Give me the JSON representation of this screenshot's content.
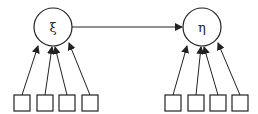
{
  "diagram": {
    "latent_left": {
      "label": "ξ",
      "cx": 53,
      "cy": 27,
      "r": 19
    },
    "latent_right": {
      "label": "η",
      "cx": 202,
      "cy": 27,
      "r": 19
    },
    "left_indicators": [
      {
        "x": 14,
        "y": 95,
        "w": 16,
        "h": 16
      },
      {
        "x": 37,
        "y": 95,
        "w": 16,
        "h": 16
      },
      {
        "x": 59,
        "y": 95,
        "w": 16,
        "h": 16
      },
      {
        "x": 82,
        "y": 95,
        "w": 16,
        "h": 16
      }
    ],
    "right_indicators": [
      {
        "x": 165,
        "y": 95,
        "w": 16,
        "h": 16
      },
      {
        "x": 188,
        "y": 95,
        "w": 16,
        "h": 16
      },
      {
        "x": 210,
        "y": 95,
        "w": 16,
        "h": 16
      },
      {
        "x": 232,
        "y": 95,
        "w": 16,
        "h": 16
      }
    ],
    "colors": {
      "stroke": "#222222",
      "background": "#ffffff"
    }
  }
}
